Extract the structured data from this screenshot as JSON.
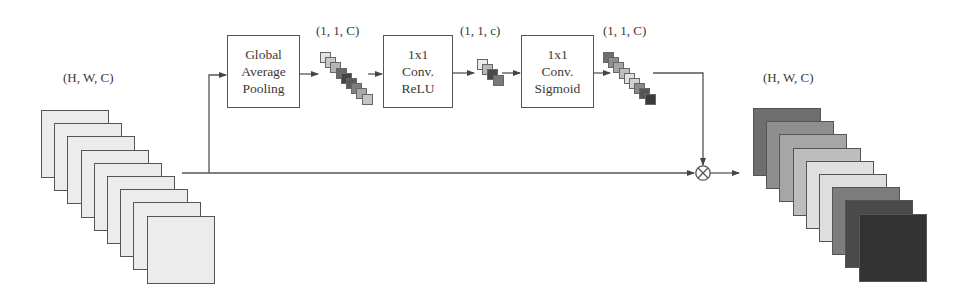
{
  "diagram": {
    "type": "squeeze-and-excitation block",
    "input": {
      "label": "(H, W, C)",
      "channel_colors": [
        "#ececec",
        "#ececec",
        "#ececec",
        "#ececec",
        "#ececec",
        "#ececec",
        "#ececec",
        "#ececec",
        "#ececec"
      ]
    },
    "blocks": [
      {
        "id": "gap",
        "lines": [
          "Global",
          "Average",
          "Pooling"
        ]
      },
      {
        "id": "conv_relu",
        "lines": [
          "1x1",
          "Conv.",
          "ReLU"
        ]
      },
      {
        "id": "conv_sigmoid",
        "lines": [
          "1x1",
          "Conv.",
          "Sigmoid"
        ]
      }
    ],
    "vectors": [
      {
        "id": "gap_out",
        "label": "(1, 1, C)",
        "colors": [
          "#e2e2e2",
          "#c8c8c8",
          "#b4b4b4",
          "#6a6a6a",
          "#444444",
          "#5a5a5a",
          "#7e7e7e",
          "#a8a8a8",
          "#c4c4c4"
        ]
      },
      {
        "id": "relu_out",
        "label": "(1, 1, c)",
        "colors": [
          "#ebebeb",
          "#b8b8b8",
          "#4a4a4a",
          "#787878"
        ]
      },
      {
        "id": "sigmoid_out",
        "label": "(1, 1, C)",
        "colors": [
          "#6e6e6e",
          "#8e8e8e",
          "#a6a6a6",
          "#bdbdbd",
          "#e0e0e0",
          "#d0d0d0",
          "#8a8a8a",
          "#555555",
          "#3a3a3a"
        ]
      }
    ],
    "operator": {
      "symbol": "⊗",
      "name": "channel-wise multiplication"
    },
    "output": {
      "label": "(H, W, C)",
      "channel_colors": [
        "#6e6e6e",
        "#8e8e8e",
        "#a6a6a6",
        "#bdbdbd",
        "#e0e0e0",
        "#dedede",
        "#7c7c7c",
        "#4a4a4a",
        "#333333"
      ]
    }
  }
}
